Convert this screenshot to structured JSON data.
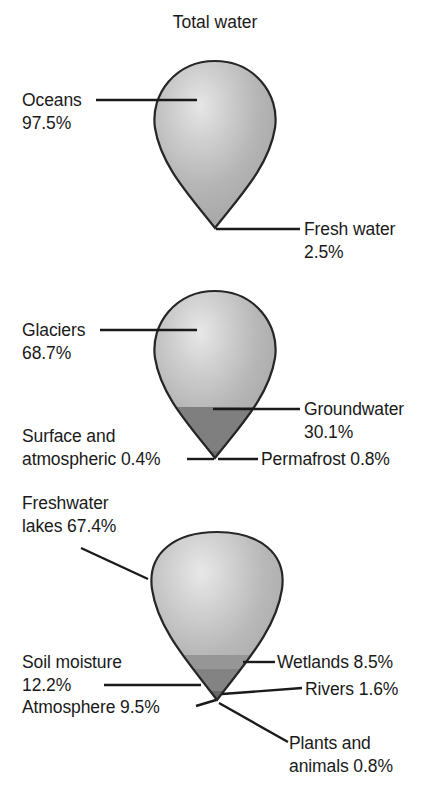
{
  "figure": {
    "title": "Total water",
    "type": "hierarchical-waterdrop-breakdown",
    "drops": [
      {
        "id": "total-water",
        "name": "Total water",
        "segments": [
          {
            "name": "Oceans",
            "percent": "97.5%",
            "label": "Oceans",
            "value_label": "97.5%"
          },
          {
            "name": "Fresh water",
            "percent": "2.5%",
            "label": "Fresh water",
            "value_label": "2.5%"
          }
        ]
      },
      {
        "id": "fresh-water",
        "name": "Fresh water",
        "segments": [
          {
            "name": "Glaciers",
            "percent": "68.7%",
            "label": "Glaciers",
            "value_label": "68.7%"
          },
          {
            "name": "Groundwater",
            "percent": "30.1%",
            "label": "Groundwater",
            "value_label": "30.1%"
          },
          {
            "name": "Permafrost",
            "percent": "0.8%",
            "label": "Permafrost 0.8%",
            "value_label": "0.8%"
          },
          {
            "name": "Surface and atmospheric",
            "percent": "0.4%",
            "label_line1": "Surface and",
            "label_line2": "atmospheric 0.4%",
            "value_label": "0.4%"
          }
        ]
      },
      {
        "id": "surface-and-atmospheric-water",
        "name": "Surface and atmospheric water",
        "segments": [
          {
            "name": "Freshwater lakes",
            "percent": "67.4%",
            "label_line1": "Freshwater",
            "label_line2": "lakes 67.4%",
            "value_label": "67.4%"
          },
          {
            "name": "Soil moisture",
            "percent": "12.2%",
            "label_line1": "Soil moisture",
            "label_line2": "12.2%",
            "value_label": "12.2%"
          },
          {
            "name": "Atmosphere",
            "percent": "9.5%",
            "label": "Atmosphere 9.5%",
            "value_label": "9.5%"
          },
          {
            "name": "Wetlands",
            "percent": "8.5%",
            "label": "Wetlands 8.5%",
            "value_label": "8.5%"
          },
          {
            "name": "Rivers",
            "percent": "1.6%",
            "label": "Rivers 1.6%",
            "value_label": "1.6%"
          },
          {
            "name": "Plants and animals",
            "percent": "0.8%",
            "label_line1": "Plants and",
            "label_line2": "animals 0.8%",
            "value_label": "0.8%"
          }
        ]
      }
    ],
    "labels": {
      "title": "Total water",
      "oceans_l1": "Oceans",
      "oceans_l2": "97.5%",
      "fresh_water_l1": "Fresh water",
      "fresh_water_l2": "2.5%",
      "glaciers_l1": "Glaciers",
      "glaciers_l2": "68.7%",
      "groundwater_l1": "Groundwater",
      "groundwater_l2": "30.1%",
      "permafrost": "Permafrost 0.8%",
      "surface_l1": "Surface and",
      "surface_l2": "atmospheric 0.4%",
      "freshwater_lakes_l1": "Freshwater",
      "freshwater_lakes_l2": "lakes 67.4%",
      "soil_moisture_l1": "Soil moisture",
      "soil_moisture_l2": "12.2%",
      "atmosphere": "Atmosphere 9.5%",
      "wetlands": "Wetlands 8.5%",
      "rivers": "Rivers 1.6%",
      "plants_l1": "Plants and",
      "plants_l2": "animals 0.8%"
    },
    "colors": {
      "light_fill": "#b3b3b3",
      "highlight": "#e0e0e0",
      "mid_fill": "#9a9a9a",
      "dark_fill": "#7d7d7d",
      "darker_fill": "#6a6a6a",
      "outline": "#262626",
      "text": "#1a1a1a",
      "background": "#ffffff"
    }
  }
}
